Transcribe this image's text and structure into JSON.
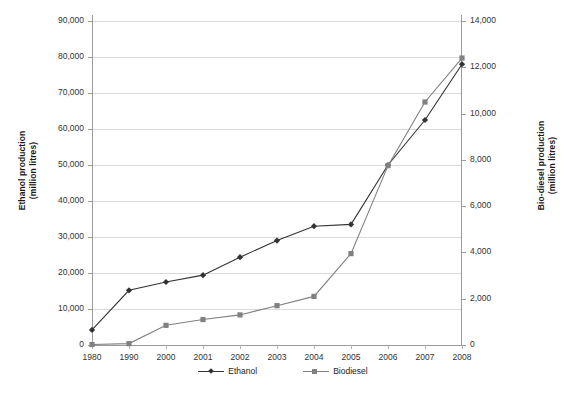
{
  "chart_data": {
    "type": "line",
    "title": "",
    "xlabel": "",
    "ylabel": "Ethanol production (million litres)",
    "ylabel_line1": "Ethanol production",
    "ylabel_line2": "(million litres)",
    "y2label": "Bio-diesel production (million litres)",
    "y2label_line1": "Bio-diesel production",
    "y2label_line2": "(million litres)",
    "grid": true,
    "legend_position": "bottom",
    "categories": [
      "1980",
      "1990",
      "2000",
      "2001",
      "2002",
      "2003",
      "2004",
      "2005",
      "2006",
      "2007",
      "2008"
    ],
    "ylim": [
      0,
      90000
    ],
    "y2lim": [
      0,
      14000
    ],
    "yticks": [
      "0",
      "10,000",
      "20,000",
      "30,000",
      "40,000",
      "50,000",
      "60,000",
      "70,000",
      "80,000",
      "90,000"
    ],
    "ytick_values": [
      0,
      10000,
      20000,
      30000,
      40000,
      50000,
      60000,
      70000,
      80000,
      90000
    ],
    "y2ticks": [
      "0",
      "2,000",
      "4,000",
      "6,000",
      "8,000",
      "10,000",
      "12,000",
      "14,000"
    ],
    "y2tick_values": [
      0,
      2000,
      4000,
      6000,
      8000,
      10000,
      12000,
      14000
    ],
    "series": [
      {
        "name": "Ethanol",
        "axis": "left",
        "marker": "diamond",
        "color": "#333333",
        "values": [
          4200,
          15200,
          17500,
          19400,
          24400,
          29000,
          33000,
          33500,
          50000,
          62500,
          78000
        ]
      },
      {
        "name": "Biodiesel",
        "axis": "right",
        "marker": "square",
        "color": "#808080",
        "values": [
          20,
          60,
          850,
          1100,
          1300,
          1700,
          2100,
          3950,
          7750,
          10500,
          12400
        ]
      }
    ]
  },
  "legend": {
    "items": [
      {
        "label": "Ethanol",
        "marker": "diamond",
        "color": "#333333"
      },
      {
        "label": "Biodiesel",
        "marker": "square",
        "color": "#808080"
      }
    ]
  }
}
